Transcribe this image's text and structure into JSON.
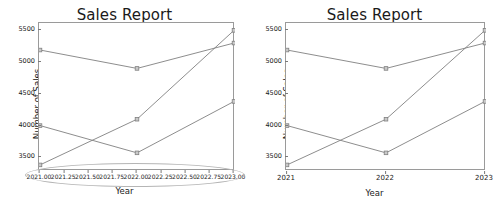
{
  "figure": {
    "panels": [
      {
        "id": "left",
        "title": "Sales Report",
        "xlabel": "Year",
        "ylabel": "Number of Sales",
        "xticks": [
          "2021.00",
          "2021.25",
          "2021.50",
          "2021.75",
          "2022.00",
          "2022.25",
          "2022.50",
          "2022.75",
          "2023.00"
        ],
        "yticks": [
          "3500",
          "4000",
          "4500",
          "5000",
          "5500"
        ],
        "annotation": "crowded-xticklabels-ellipse"
      },
      {
        "id": "right",
        "title": "Sales Report",
        "xlabel": "Year",
        "ylabel": "Number of Sales",
        "xticks": [
          "2021",
          "2022",
          "2023"
        ],
        "yticks": [
          "3500",
          "4000",
          "4500",
          "5000",
          "5500"
        ],
        "annotation": ""
      }
    ]
  },
  "chart_data": [
    {
      "type": "line",
      "panel": "left",
      "title": "Sales Report",
      "xlabel": "Year",
      "ylabel": "Number of Sales",
      "x": [
        2021,
        2022,
        2023
      ],
      "xtick_values": [
        2021.0,
        2021.25,
        2021.5,
        2021.75,
        2022.0,
        2022.25,
        2022.5,
        2022.75,
        2023.0
      ],
      "xtick_labels": [
        "2021.00",
        "2021.25",
        "2021.50",
        "2021.75",
        "2022.00",
        "2022.25",
        "2022.50",
        "2022.75",
        "2023.00"
      ],
      "ytick_values": [
        3500,
        4000,
        4500,
        5000,
        5500
      ],
      "xlim": [
        2021,
        2023
      ],
      "ylim": [
        3300,
        5600
      ],
      "grid": false,
      "legend": "none",
      "marker": "square",
      "series": [
        {
          "name": "Series 1",
          "values": [
            5190,
            4900,
            5300
          ],
          "color": "#808080"
        },
        {
          "name": "Series 2",
          "values": [
            4000,
            3570,
            4380
          ],
          "color": "#808080"
        },
        {
          "name": "Series 3",
          "values": [
            3380,
            4100,
            5500
          ],
          "color": "#808080"
        }
      ]
    },
    {
      "type": "line",
      "panel": "right",
      "title": "Sales Report",
      "xlabel": "Year",
      "ylabel": "Number of Sales",
      "x": [
        2021,
        2022,
        2023
      ],
      "xtick_values": [
        2021,
        2022,
        2023
      ],
      "xtick_labels": [
        "2021",
        "2022",
        "2023"
      ],
      "ytick_values": [
        3500,
        4000,
        4500,
        5000,
        5500
      ],
      "xlim": [
        2021,
        2023
      ],
      "ylim": [
        3300,
        5600
      ],
      "grid": false,
      "legend": "none",
      "marker": "square",
      "series": [
        {
          "name": "Series 1",
          "values": [
            5190,
            4900,
            5300
          ],
          "color": "#808080"
        },
        {
          "name": "Series 2",
          "values": [
            4000,
            3570,
            4380
          ],
          "color": "#808080"
        },
        {
          "name": "Series 3",
          "values": [
            3380,
            4100,
            5500
          ],
          "color": "#808080"
        }
      ]
    }
  ]
}
